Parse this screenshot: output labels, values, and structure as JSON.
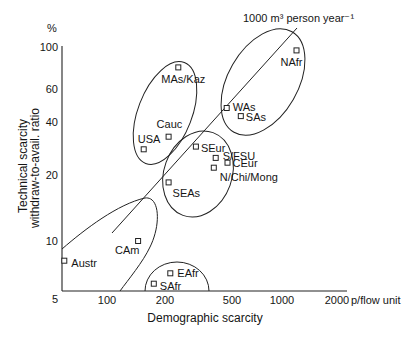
{
  "chart_data": {
    "type": "scatter",
    "title": "",
    "xlabel": "Demographic scarcity",
    "x_unit": "p/flow unit",
    "ylabel": [
      "Technical scarcity",
      "withdraw-to-avail. ratio"
    ],
    "y_unit": "%",
    "x_scale": "log",
    "y_scale": "log",
    "x_ticks": [
      "100",
      "200",
      "500",
      "1000",
      "2000"
    ],
    "y_ticks": [
      "5",
      "10",
      "20",
      "40",
      "60",
      "100"
    ],
    "xlim": [
      60,
      2300
    ],
    "ylim": [
      5,
      100
    ],
    "grid": false,
    "legend": null,
    "marker": "open-square",
    "points": [
      {
        "label": "NAfr",
        "x": 1200,
        "y": 96
      },
      {
        "label": "WAs",
        "x": 465,
        "y": 47.5
      },
      {
        "label": "SAs",
        "x": 565,
        "y": 43
      },
      {
        "label": "MAs/Kaz",
        "x": 240,
        "y": 78
      },
      {
        "label": "Cauc",
        "x": 210,
        "y": 33
      },
      {
        "label": "USA",
        "x": 155,
        "y": 28
      },
      {
        "label": "SEur",
        "x": 305,
        "y": 29
      },
      {
        "label": "S/FSU",
        "x": 400,
        "y": 25
      },
      {
        "label": "CEur",
        "x": 470,
        "y": 23.5
      },
      {
        "label": "N/Chi/Mong",
        "x": 390,
        "y": 22
      },
      {
        "label": "SEAs",
        "x": 210,
        "y": 18.5
      },
      {
        "label": "CAm",
        "x": 145,
        "y": 10
      },
      {
        "label": "Austr",
        "x": 60,
        "y": 7.9
      },
      {
        "label": "EAfr",
        "x": 215,
        "y": 6.8
      },
      {
        "label": "SAfr",
        "x": 175,
        "y": 6.0
      }
    ],
    "groups": [
      {
        "shape": "ellipse",
        "members": [
          "MAs/Kaz",
          "Cauc",
          "USA"
        ]
      },
      {
        "shape": "ellipse",
        "members": [
          "NAfr",
          "WAs",
          "SAs"
        ]
      },
      {
        "shape": "ellipse",
        "members": [
          "SEur",
          "S/FSU",
          "CEur",
          "N/Chi/Mong",
          "SEAs"
        ]
      },
      {
        "shape": "half-ellipse",
        "members": [
          "EAfr",
          "SAfr"
        ]
      },
      {
        "shape": "corner-region",
        "members": [
          "CAm",
          "Austr"
        ]
      }
    ],
    "annotations": [
      {
        "type": "line",
        "text": "1000 m³ person year⁻¹"
      }
    ]
  }
}
